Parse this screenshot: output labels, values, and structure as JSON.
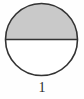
{
  "figure": {
    "caption": "1",
    "shape": "circle",
    "total_parts": 2,
    "shaded_parts": 1,
    "shaded_region": "top-half",
    "unshaded_region": "bottom-half",
    "fraction_shaded": "1/2",
    "geometry": {
      "center_x": 41.5,
      "center_y": 39.5,
      "radius": 36,
      "divider_y": 39.5,
      "divider_orientation": "horizontal"
    },
    "colors": {
      "outline": "#333333",
      "shaded_fill": "#c9c9c9",
      "unshaded_fill": "#ffffff",
      "background": "#fefefe",
      "caption_text": "#2b2b2b"
    },
    "stroke_width": 1.6
  }
}
